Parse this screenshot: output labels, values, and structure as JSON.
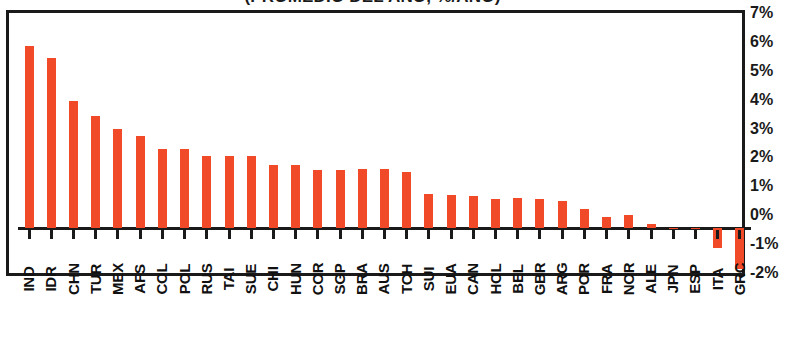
{
  "chart_data": {
    "type": "bar",
    "title": "(PROMEDIO DEL AÑO, %/AÑO)",
    "xlabel": "",
    "ylabel": "",
    "ylim": [
      -2,
      7
    ],
    "ytick_labels": [
      "7%",
      "6%",
      "5%",
      "4%",
      "3%",
      "2%",
      "1%",
      "0%",
      "-1%",
      "-2%"
    ],
    "ytick_values": [
      7,
      6,
      5,
      4,
      3,
      2,
      1,
      0,
      -1,
      -2
    ],
    "grid": false,
    "legend": "none",
    "bar_color": "#F04A28",
    "axis_color": "#1A1A1A",
    "categories": [
      "IND",
      "IDR",
      "CHN",
      "TUR",
      "MEX",
      "AFS",
      "COL",
      "POL",
      "RUS",
      "TAI",
      "SUE",
      "CHI",
      "HUN",
      "COR",
      "SGP",
      "BRA",
      "AUS",
      "TCH",
      "SUI",
      "EUA",
      "CAN",
      "HOL",
      "BEL",
      "GBR",
      "ARG",
      "POR",
      "FRA",
      "NOR",
      "ALE",
      "JPN",
      "ESP",
      "ITA",
      "GRC"
    ],
    "values": [
      6.3,
      5.9,
      4.4,
      3.9,
      3.45,
      3.2,
      2.75,
      2.75,
      2.5,
      2.5,
      2.5,
      2.2,
      2.2,
      2.0,
      2.0,
      2.05,
      2.05,
      1.95,
      1.2,
      1.15,
      1.1,
      1.0,
      1.05,
      1.0,
      0.95,
      0.65,
      0.4,
      0.45,
      0.15,
      0.02,
      0.02,
      -0.7,
      -1.4
    ]
  }
}
